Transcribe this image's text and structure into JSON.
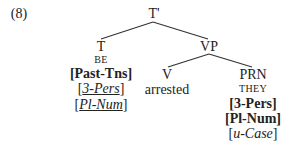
{
  "example_number": "(8)",
  "tree": {
    "root": {
      "label": "T'"
    },
    "t_node": {
      "label": "T",
      "lexeme": "BE",
      "features": [
        {
          "open": "[",
          "text": "Past-Tns",
          "close": "]",
          "style": "bold"
        },
        {
          "open": "[",
          "text": "3-Pers",
          "close": "]",
          "style": "italic-underline"
        },
        {
          "open": "[",
          "text": "Pl-Num",
          "close": "]",
          "style": "italic-underline"
        }
      ]
    },
    "vp_node": {
      "label": "VP"
    },
    "v_node": {
      "label": "V",
      "word": "arrested"
    },
    "prn_node": {
      "label": "PRN",
      "lexeme": "THEY",
      "features": [
        {
          "open": "[",
          "text": "3-Pers",
          "close": "]",
          "style": "bold"
        },
        {
          "open": "[",
          "text": "Pl-Num",
          "close": "]",
          "style": "bold"
        },
        {
          "open": "[",
          "text": "u-Case",
          "close": "]",
          "style": "italic"
        }
      ]
    }
  }
}
